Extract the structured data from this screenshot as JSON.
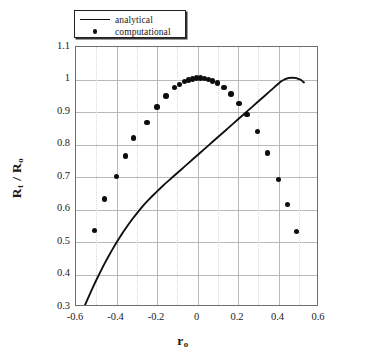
{
  "chart_data": {
    "type": "line",
    "title": "",
    "xlabel": "r o",
    "ylabel": "R t / R o",
    "xlim": [
      -0.6,
      0.6
    ],
    "ylim": [
      0.3,
      1.1
    ],
    "xticks": [
      "-0.6",
      "-0.4",
      "-0.2",
      "0",
      "0.2",
      "0.4",
      "0.6"
    ],
    "xtick_values": [
      -0.6,
      -0.4,
      -0.2,
      0,
      0.2,
      0.4,
      0.6
    ],
    "yticks": [
      "0.3",
      "0.4",
      "0.5",
      "0.6",
      "0.7",
      "0.8",
      "0.9",
      "1",
      "1.1"
    ],
    "ytick_values": [
      0.3,
      0.4,
      0.5,
      0.6,
      0.7,
      0.8,
      0.9,
      1.0,
      1.1
    ],
    "grid": true,
    "grid_color": "#b9b9b9",
    "legend_position": "top-left-outside",
    "series": [
      {
        "name": "analytical",
        "style": "line",
        "color": "#111111",
        "x": [
          -0.555,
          -0.54,
          -0.52,
          -0.5,
          -0.48,
          -0.46,
          -0.44,
          -0.42,
          -0.4,
          -0.38,
          -0.36,
          -0.34,
          -0.32,
          -0.3,
          -0.28,
          -0.26,
          -0.24,
          -0.22,
          -0.2,
          -0.18,
          -0.16,
          -0.14,
          -0.12,
          -0.1,
          -0.08,
          -0.06,
          -0.04,
          -0.02,
          0.0,
          0.02,
          0.04,
          0.06,
          0.08,
          0.1,
          0.12,
          0.14,
          0.16,
          0.18,
          0.2,
          0.22,
          0.24,
          0.26,
          0.28,
          0.3,
          0.32,
          0.34,
          0.36,
          0.38,
          0.4,
          0.42,
          0.44,
          0.46,
          0.48,
          0.5,
          0.52,
          0.535
        ],
        "y": [
          0.3,
          0.321,
          0.349,
          0.376,
          0.401,
          0.426,
          0.449,
          0.471,
          0.492,
          0.512,
          0.531,
          0.549,
          0.566,
          0.582,
          0.597,
          0.612,
          0.625,
          0.638,
          0.65,
          0.662,
          0.674,
          0.685,
          0.696,
          0.707,
          0.718,
          0.729,
          0.74,
          0.751,
          0.762,
          0.773,
          0.784,
          0.795,
          0.806,
          0.817,
          0.828,
          0.839,
          0.85,
          0.861,
          0.872,
          0.883,
          0.894,
          0.905,
          0.916,
          0.927,
          0.938,
          0.949,
          0.96,
          0.971,
          0.982,
          0.993,
          1.0,
          1.004,
          1.005,
          1.003,
          0.998,
          0.99
        ]
      },
      {
        "name": "computational",
        "style": "markers",
        "color": "#0d0d0d",
        "x": [
          -0.51,
          -0.46,
          -0.4,
          -0.355,
          -0.315,
          -0.25,
          -0.2,
          -0.155,
          -0.115,
          -0.09,
          -0.065,
          -0.045,
          -0.025,
          -0.005,
          0.015,
          0.035,
          0.055,
          0.075,
          0.1,
          0.13,
          0.165,
          0.205,
          0.245,
          0.295,
          0.345,
          0.4,
          0.445,
          0.49
        ],
        "y": [
          0.535,
          0.632,
          0.702,
          0.765,
          0.82,
          0.868,
          0.916,
          0.949,
          0.975,
          0.985,
          0.993,
          0.998,
          1.002,
          1.005,
          1.005,
          1.003,
          1.0,
          0.996,
          0.989,
          0.975,
          0.955,
          0.927,
          0.893,
          0.84,
          0.774,
          0.692,
          0.615,
          0.533
        ]
      }
    ]
  },
  "legend": {
    "items": [
      {
        "label": "analytical",
        "key": "line"
      },
      {
        "label": "computational",
        "key": "dot"
      }
    ]
  },
  "axis_titles": {
    "y_main": "R",
    "y_sub1": "t",
    "y_mid": " / R",
    "y_sub2": "o",
    "x_main": "r",
    "x_sub": "o"
  }
}
